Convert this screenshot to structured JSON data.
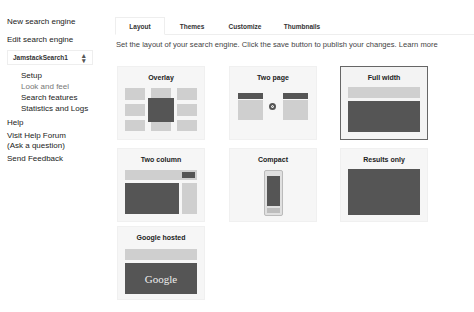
{
  "sidebar": {
    "new_engine": "New search engine",
    "edit_engine": "Edit search engine",
    "engine_select": {
      "value": "JamstackSearch1",
      "icon": "up-down-arrows-icon"
    },
    "sub_items": [
      {
        "label": "Setup",
        "active": false
      },
      {
        "label": "Look and feel",
        "active": true
      },
      {
        "label": "Search features",
        "active": false
      },
      {
        "label": "Statistics and Logs",
        "active": false
      }
    ],
    "help": "Help",
    "forum_line1": "Visit Help Forum",
    "forum_line2": "(Ask a question)",
    "feedback": "Send Feedback"
  },
  "tabs": [
    {
      "label": "Layout",
      "active": true
    },
    {
      "label": "Themes",
      "active": false
    },
    {
      "label": "Customize",
      "active": false
    },
    {
      "label": "Thumbnails",
      "active": false
    }
  ],
  "description": {
    "text": "Set the layout of your search engine. Click the save button to publish your changes.",
    "link": "Learn more"
  },
  "layouts": [
    {
      "title": "Overlay",
      "selected": false
    },
    {
      "title": "Two page",
      "selected": false
    },
    {
      "title": "Full width",
      "selected": true
    },
    {
      "title": "Two column",
      "selected": false
    },
    {
      "title": "Compact",
      "selected": false
    },
    {
      "title": "Results only",
      "selected": false
    },
    {
      "title": "Google hosted",
      "selected": false,
      "logo_text": "Google"
    }
  ],
  "colors": {
    "light_block": "#cfcfcf",
    "dark_block": "#555555",
    "selected_border": "#666666"
  }
}
